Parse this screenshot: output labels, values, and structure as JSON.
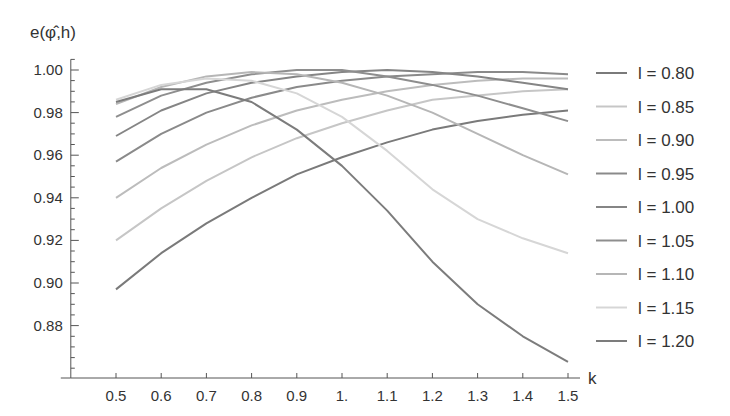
{
  "chart_data": {
    "type": "line",
    "title": "",
    "xlabel": "k",
    "ylabel": "e(φ̂,h)",
    "xlim": [
      0.4,
      1.52
    ],
    "ylim": [
      0.855,
      1.005
    ],
    "grid": false,
    "legend_position": "right",
    "x": [
      0.5,
      0.6,
      0.7,
      0.8,
      0.9,
      1.0,
      1.1,
      1.2,
      1.3,
      1.4,
      1.5
    ],
    "x_tick_labels": [
      "0.5",
      "0.6",
      "0.7",
      "0.8",
      "0.9",
      "1.",
      "1.1",
      "1.2",
      "1.3",
      "1.4",
      "1.5"
    ],
    "y_ticks": [
      0.88,
      0.9,
      0.92,
      0.94,
      0.96,
      0.98,
      1.0
    ],
    "y_tick_labels": [
      "0.88",
      "0.90",
      "0.92",
      "0.94",
      "0.96",
      "0.98",
      "1.00"
    ],
    "series": [
      {
        "name": "l = 0.80",
        "color": "#7a7a7a",
        "values": [
          0.897,
          0.914,
          0.928,
          0.94,
          0.951,
          0.959,
          0.966,
          0.972,
          0.976,
          0.979,
          0.981
        ]
      },
      {
        "name": "l = 0.85",
        "color": "#c6c6c6",
        "values": [
          0.92,
          0.935,
          0.948,
          0.959,
          0.968,
          0.975,
          0.981,
          0.986,
          0.988,
          0.99,
          0.991
        ]
      },
      {
        "name": "l = 0.90",
        "color": "#bcbcbc",
        "values": [
          0.94,
          0.954,
          0.965,
          0.974,
          0.981,
          0.986,
          0.99,
          0.993,
          0.995,
          0.996,
          0.996
        ]
      },
      {
        "name": "l = 0.95",
        "color": "#8a8a8a",
        "values": [
          0.957,
          0.97,
          0.98,
          0.987,
          0.992,
          0.995,
          0.997,
          0.998,
          0.999,
          0.999,
          0.998
        ]
      },
      {
        "name": "l = 1.00",
        "color": "#858585",
        "values": [
          0.969,
          0.981,
          0.989,
          0.994,
          0.997,
          0.999,
          1.0,
          0.999,
          0.997,
          0.994,
          0.991
        ]
      },
      {
        "name": "l = 1.05",
        "color": "#8e8e8e",
        "values": [
          0.978,
          0.988,
          0.994,
          0.998,
          1.0,
          1.0,
          0.997,
          0.993,
          0.988,
          0.982,
          0.976
        ]
      },
      {
        "name": "l = 1.10",
        "color": "#b6b6b6",
        "values": [
          0.984,
          0.992,
          0.997,
          0.999,
          0.998,
          0.994,
          0.988,
          0.98,
          0.97,
          0.96,
          0.951
        ]
      },
      {
        "name": "l = 1.15",
        "color": "#d6d6d6",
        "values": [
          0.986,
          0.993,
          0.996,
          0.995,
          0.989,
          0.978,
          0.962,
          0.944,
          0.93,
          0.921,
          0.914
        ]
      },
      {
        "name": "l = 1.20",
        "color": "#7c7c7c",
        "values": [
          0.985,
          0.991,
          0.991,
          0.985,
          0.972,
          0.955,
          0.934,
          0.91,
          0.89,
          0.875,
          0.863
        ]
      }
    ]
  }
}
